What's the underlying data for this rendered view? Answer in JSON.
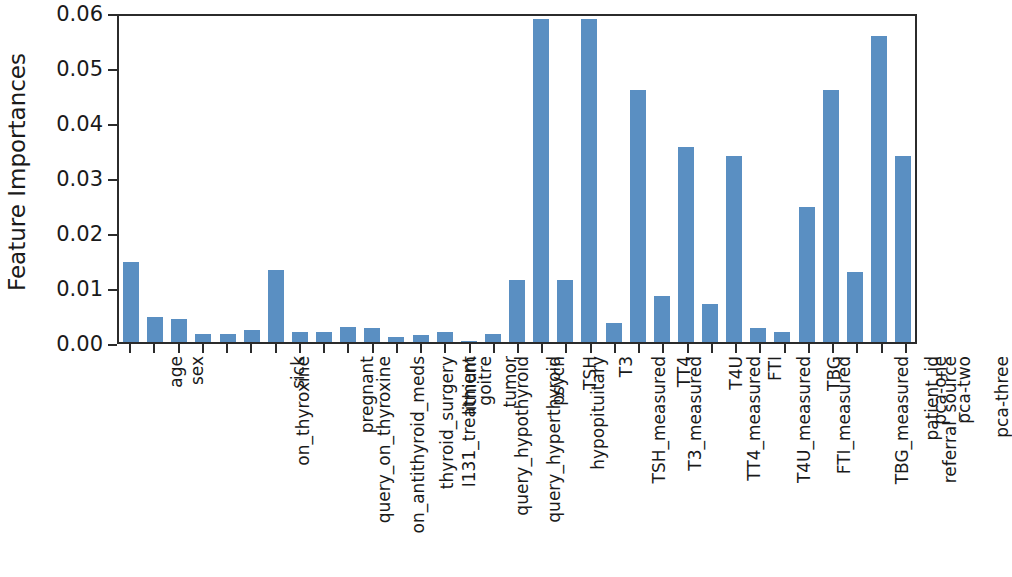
{
  "chart_data": {
    "type": "bar",
    "title": "",
    "xlabel": "",
    "ylabel": "Feature Importances",
    "ylim": [
      0.0,
      0.06
    ],
    "yticks": [
      "0.00",
      "0.01",
      "0.02",
      "0.03",
      "0.04",
      "0.05",
      "0.06"
    ],
    "ytick_values": [
      0.0,
      0.01,
      0.02,
      0.03,
      0.04,
      0.05,
      0.06
    ],
    "grid": false,
    "legend": null,
    "bar_color": "#5a8fc2",
    "axis_color": "#2b2b2b",
    "categories": [
      "age",
      "sex",
      "on_thyroxine",
      "query_on_thyroxine",
      "on_antithyroid_meds",
      "sick",
      "pregnant",
      "thyroid_surgery",
      "I131_treatment",
      "query_hypothyroid",
      "query_hyperthyroid",
      "lithium",
      "goitre",
      "tumor",
      "hypopituitary",
      "psych",
      "TSH_measured",
      "TSH",
      "T3_measured",
      "T3",
      "TT4_measured",
      "TT4",
      "T4U_measured",
      "T4U",
      "FTI_measured",
      "FTI",
      "TBG_measured",
      "TBG",
      "referral_source",
      "patient_id",
      "pca-one",
      "pca-two",
      "pca-three"
    ],
    "values": [
      0.0146,
      0.0046,
      0.0042,
      0.0014,
      0.0015,
      0.0021,
      0.0131,
      0.0019,
      0.0018,
      0.0027,
      0.0025,
      0.0009,
      0.0012,
      0.0019,
      0.0001,
      0.0014,
      0.0112,
      0.0588,
      0.0112,
      0.0588,
      0.0035,
      0.0459,
      0.0084,
      0.0355,
      0.0069,
      0.0339,
      0.0025,
      0.0018,
      0.0245,
      0.0458,
      0.0128,
      0.0556,
      0.0339
    ]
  }
}
